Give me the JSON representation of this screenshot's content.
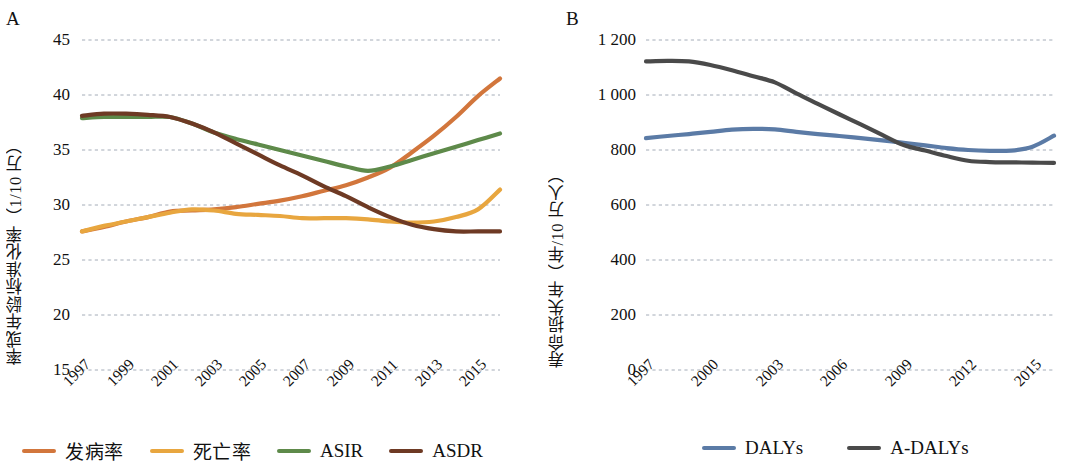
{
  "figure": {
    "panels": [
      {
        "letter": "A",
        "ylabel": "率或年龄标准化率（1/10 万）",
        "legend": [
          {
            "label": "发病率",
            "color": "#D2763C",
            "cjk": true
          },
          {
            "label": "死亡率",
            "color": "#E8A63F",
            "cjk": true
          },
          {
            "label": "ASIR",
            "color": "#5E8A4A",
            "cjk": false
          },
          {
            "label": "ASDR",
            "color": "#6E3A24",
            "cjk": false
          }
        ]
      },
      {
        "letter": "B",
        "ylabel": "寿命损失年（年/10 万人）",
        "legend": [
          {
            "label": "DALYs",
            "color": "#5B7BA6",
            "cjk": false
          },
          {
            "label": "A-DALYs",
            "color": "#4A4A4A",
            "cjk": false
          }
        ]
      }
    ]
  },
  "chart_data": [
    {
      "type": "line",
      "panel": "A",
      "title": "",
      "xlabel": "",
      "ylabel": "率或年龄标准化率（1/10 万）",
      "grid": true,
      "legend_position": "bottom",
      "ylim": [
        15,
        45
      ],
      "yticks": [
        15,
        20,
        25,
        30,
        35,
        40,
        45
      ],
      "ytick_labels": [
        "15",
        "20",
        "25",
        "30",
        "35",
        "40",
        "45"
      ],
      "x": [
        1997,
        1998,
        1999,
        2000,
        2001,
        2002,
        2003,
        2004,
        2005,
        2006,
        2007,
        2008,
        2009,
        2010,
        2011,
        2012,
        2013,
        2014,
        2015,
        2016
      ],
      "xticks": [
        1997,
        1999,
        2001,
        2003,
        2005,
        2007,
        2009,
        2011,
        2013,
        2015
      ],
      "xtick_labels": [
        "1997",
        "1999",
        "2001",
        "2003",
        "2005",
        "2007",
        "2009",
        "2011",
        "2013",
        "2015"
      ],
      "series": [
        {
          "name": "发病率",
          "color": "#D2763C",
          "values": [
            27.6,
            28.0,
            28.5,
            28.9,
            29.4,
            29.5,
            29.6,
            29.8,
            30.1,
            30.4,
            30.8,
            31.3,
            31.8,
            32.5,
            33.4,
            34.8,
            36.3,
            38.0,
            39.9,
            41.5
          ]
        },
        {
          "name": "死亡率",
          "color": "#E8A63F",
          "values": [
            27.6,
            28.1,
            28.5,
            28.9,
            29.3,
            29.6,
            29.5,
            29.2,
            29.1,
            29.0,
            28.8,
            28.8,
            28.8,
            28.7,
            28.5,
            28.4,
            28.5,
            28.9,
            29.6,
            31.4
          ]
        },
        {
          "name": "ASIR",
          "color": "#5E8A4A",
          "values": [
            37.9,
            38.0,
            38.0,
            38.0,
            38.0,
            37.4,
            36.6,
            36.0,
            35.5,
            35.0,
            34.5,
            34.0,
            33.5,
            33.1,
            33.5,
            34.1,
            34.7,
            35.3,
            35.9,
            36.5
          ]
        },
        {
          "name": "ASDR",
          "color": "#6E3A24",
          "values": [
            38.1,
            38.3,
            38.3,
            38.2,
            38.0,
            37.4,
            36.6,
            35.6,
            34.6,
            33.6,
            32.7,
            31.7,
            30.8,
            29.8,
            28.9,
            28.2,
            27.8,
            27.6,
            27.6,
            27.6
          ]
        }
      ]
    },
    {
      "type": "line",
      "panel": "B",
      "title": "",
      "xlabel": "",
      "ylabel": "寿命损失年（年/10 万人）",
      "grid": true,
      "legend_position": "bottom",
      "ylim": [
        0,
        1200
      ],
      "yticks": [
        0,
        200,
        400,
        600,
        800,
        1000,
        1200
      ],
      "ytick_labels": [
        "0",
        "200",
        "400",
        "600",
        "800",
        "1 000",
        "1 200"
      ],
      "x": [
        1997,
        1998,
        1999,
        2000,
        2001,
        2002,
        2003,
        2004,
        2005,
        2006,
        2007,
        2008,
        2009,
        2010,
        2011,
        2012,
        2013,
        2014,
        2015,
        2016
      ],
      "xticks": [
        1997,
        2000,
        2003,
        2006,
        2009,
        2012,
        2015
      ],
      "xtick_labels": [
        "1997",
        "2000",
        "2003",
        "2006",
        "2009",
        "2012",
        "2015"
      ],
      "series": [
        {
          "name": "DALYs",
          "color": "#5B7BA6",
          "values": [
            843,
            851,
            858,
            866,
            874,
            877,
            875,
            866,
            858,
            851,
            843,
            835,
            826,
            817,
            807,
            800,
            797,
            798,
            812,
            852
          ]
        },
        {
          "name": "A-DALYs",
          "color": "#4A4A4A",
          "values": [
            1122,
            1124,
            1122,
            1109,
            1090,
            1068,
            1046,
            1006,
            968,
            930,
            893,
            855,
            818,
            798,
            778,
            761,
            756,
            755,
            754,
            753
          ]
        }
      ]
    }
  ]
}
